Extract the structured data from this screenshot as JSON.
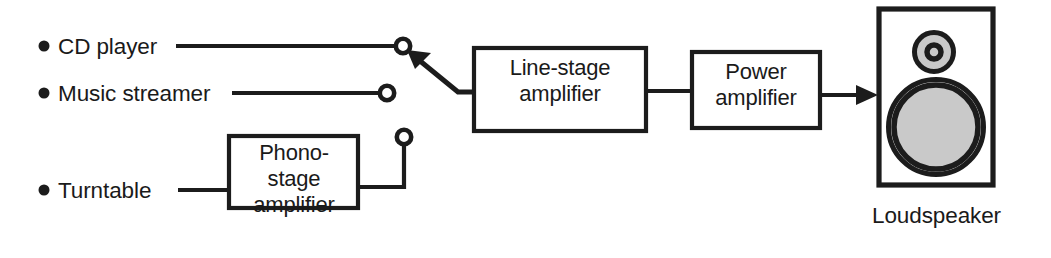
{
  "diagram": {
    "type": "block-diagram",
    "colors": {
      "line": "#1c1c1c",
      "background": "#ffffff",
      "driver_fill": "#c9c9c9"
    },
    "sources": [
      {
        "id": "cd-player",
        "label": "CD player"
      },
      {
        "id": "music-streamer",
        "label": "Music streamer"
      },
      {
        "id": "turntable",
        "label": "Turntable"
      }
    ],
    "blocks": [
      {
        "id": "phono-stage-amplifier",
        "lines": [
          "Phono-",
          "stage",
          "amplifier"
        ]
      },
      {
        "id": "line-stage-amplifier",
        "lines": [
          "Line-stage",
          "amplifier"
        ]
      },
      {
        "id": "power-amplifier",
        "lines": [
          "Power",
          "amplifier"
        ]
      }
    ],
    "output": {
      "id": "loudspeaker",
      "caption": "Loudspeaker"
    },
    "selector": {
      "id": "input-selector-switch",
      "terminals": 3,
      "selected_terminal": 1,
      "selected_source": "CD player"
    }
  }
}
